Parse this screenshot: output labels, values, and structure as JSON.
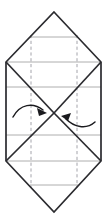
{
  "figure": {
    "width": 108,
    "height": 223,
    "background_color": "#ffffff"
  },
  "colors": {
    "outline": "#2b2b2f",
    "fold_line": "#2b2b2f",
    "guide_line": "#9a9a9a",
    "dashed_crease": "#9a9aa2",
    "arrow": "#1a1a1e"
  },
  "geometry": {
    "top_apex": {
      "x": 54,
      "y": 12
    },
    "bottom_apex": {
      "x": 54,
      "y": 212
    },
    "left_vertex_top": {
      "x": 6,
      "y": 62
    },
    "right_vertex_top": {
      "x": 101,
      "y": 62
    },
    "left_vertex_bottom": {
      "x": 6,
      "y": 161
    },
    "right_vertex_bottom": {
      "x": 101,
      "y": 161
    },
    "center_crossing": {
      "x": 54,
      "y": 113
    }
  },
  "outline_path": "M 54 12 L 101 62 L 101 161 L 54 212 L 6 161 L 6 62 Z",
  "fold_lines": [
    {
      "name": "diagonal-top-left-to-center",
      "x1": 6,
      "y1": 62,
      "x2": 54,
      "y2": 113
    },
    {
      "name": "diagonal-top-right-to-center",
      "x1": 101,
      "y1": 62,
      "x2": 54,
      "y2": 113
    },
    {
      "name": "diagonal-center-to-bottom-left",
      "x1": 54,
      "y1": 113,
      "x2": 6,
      "y2": 161
    },
    {
      "name": "diagonal-center-to-bottom-right",
      "x1": 54,
      "y1": 113,
      "x2": 101,
      "y2": 161
    }
  ],
  "guide_lines": [
    {
      "name": "guide-line-1",
      "y": 37,
      "x1": 30,
      "x2": 78
    },
    {
      "name": "guide-line-2",
      "y": 62,
      "x1": 6,
      "x2": 101
    },
    {
      "name": "guide-line-3",
      "y": 87,
      "x1": 6,
      "x2": 101
    },
    {
      "name": "guide-line-4",
      "y": 135,
      "x1": 6,
      "x2": 101
    },
    {
      "name": "guide-line-5",
      "y": 161,
      "x1": 6,
      "x2": 101
    },
    {
      "name": "guide-line-6",
      "y": 185,
      "x1": 30,
      "x2": 78
    }
  ],
  "dashed_creases": [
    {
      "name": "dashed-crease-left",
      "x": 31,
      "y1": 35,
      "y2": 188
    },
    {
      "name": "dashed-crease-right",
      "x": 77,
      "y1": 35,
      "y2": 188
    }
  ],
  "arrows": [
    {
      "name": "fold-arrow-left",
      "direction": "points-right-toward-center",
      "path": "M 13 117 C 20 104, 33 102, 43 110",
      "head_points": "47 113, 37 108, 39 116"
    },
    {
      "name": "fold-arrow-right",
      "direction": "points-left-toward-center",
      "path": "M 95 122 C 86 130, 74 127, 66 119",
      "head_points": "61 116, 71 113, 68 121"
    }
  ]
}
